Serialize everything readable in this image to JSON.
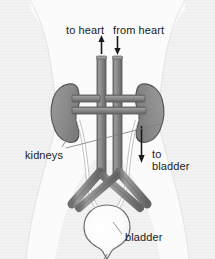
{
  "figure": {
    "background_color": "#f2f2f2",
    "body_silhouette_color": "#fbfbfb",
    "vessel_color": "#8a8a8a",
    "vessel_outline_color": "#5e5e5e",
    "kidney_color": "#8f8f8f",
    "kidney_outline_color": "#4f4f4f",
    "bladder_color": "#fdfdfd",
    "bladder_outline_color": "#6e6e6e",
    "ureter_color": "#ffffff",
    "text_color": "#1a1a1a",
    "leader_line_color": "#7a7a7a"
  },
  "labels": {
    "to_heart": "to heart",
    "from_heart": "from heart",
    "kidneys": "kidneys",
    "to_bladder_line1": "to",
    "to_bladder_line2": "bladder",
    "bladder": "bladder"
  },
  "arrows": [
    {
      "name": "to-heart-arrow",
      "direction": "up",
      "label": "to heart"
    },
    {
      "name": "from-heart-arrow",
      "direction": "down",
      "label": "from heart"
    },
    {
      "name": "to-bladder-arrow",
      "direction": "down",
      "label": "to bladder"
    }
  ],
  "anatomy": {
    "structures": [
      "left kidney",
      "right kidney",
      "aorta",
      "vena cava",
      "renal arteries",
      "renal veins",
      "iliac vessels",
      "left ureter",
      "right ureter",
      "bladder",
      "urethra"
    ]
  }
}
